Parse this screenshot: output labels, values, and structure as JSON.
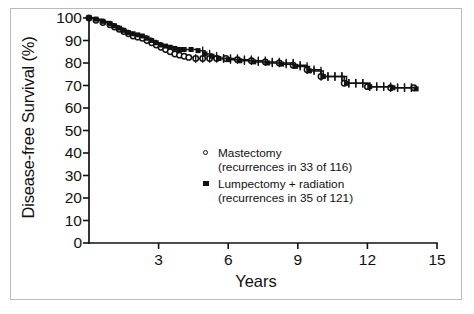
{
  "chart_data": {
    "type": "line",
    "title": "",
    "subtitle": "",
    "xlabel": "Years",
    "ylabel": "Disease-free Survival (%)",
    "xlim": [
      0,
      15
    ],
    "ylim": [
      0,
      100
    ],
    "xticks": [
      3,
      6,
      9,
      12,
      15
    ],
    "yticks": [
      0,
      10,
      20,
      30,
      40,
      50,
      60,
      70,
      80,
      90,
      100
    ],
    "grid": false,
    "legend_position": "center",
    "series": [
      {
        "name": "Mastectomy",
        "annotation": "(recurrences in 33 of 116)",
        "marker": "open-circle",
        "color": "#111111",
        "events": 33,
        "total": 116,
        "x": [
          0.0,
          0.3,
          0.6,
          0.9,
          1.1,
          1.3,
          1.5,
          1.7,
          1.9,
          2.1,
          2.3,
          2.5,
          2.7,
          2.9,
          3.1,
          3.3,
          3.5,
          3.7,
          3.9,
          4.1,
          4.3,
          4.6,
          4.9,
          5.2,
          5.5,
          5.9,
          6.4,
          7.0,
          7.6,
          8.2,
          8.8,
          9.4,
          10.0,
          11.0,
          12.0,
          13.0,
          14.0
        ],
        "y": [
          100,
          99,
          98,
          97,
          96,
          95,
          94,
          93,
          92,
          91.5,
          91,
          90,
          89,
          88,
          87,
          86,
          85,
          84,
          83.5,
          83,
          82.5,
          82,
          82,
          82,
          82,
          82,
          81.5,
          81,
          80.5,
          80,
          79,
          77,
          74,
          71,
          69.5,
          69,
          69
        ]
      },
      {
        "name": "Lumpectomy + radiation",
        "annotation": "(recurrences in 35 of 121)",
        "marker": "filled-square",
        "color": "#111111",
        "events": 35,
        "total": 121,
        "x": [
          0.0,
          0.3,
          0.6,
          0.9,
          1.1,
          1.3,
          1.5,
          1.7,
          1.9,
          2.1,
          2.3,
          2.5,
          2.7,
          2.9,
          3.1,
          3.3,
          3.5,
          3.7,
          3.9,
          4.1,
          4.4,
          4.7,
          5.0,
          5.3,
          5.6,
          6.0,
          6.5,
          7.1,
          7.7,
          8.3,
          8.9,
          9.5,
          10.1,
          11.1,
          12.1,
          13.1,
          14.1
        ],
        "y": [
          100,
          99.5,
          98.5,
          97.5,
          96.5,
          95.5,
          94.5,
          93.5,
          93,
          92.5,
          92,
          91,
          90,
          89,
          88,
          87.5,
          87,
          86.5,
          86,
          86,
          86,
          85.5,
          84,
          83,
          82,
          81.5,
          81,
          80.5,
          80,
          79.5,
          78.5,
          76.5,
          74,
          71,
          69.5,
          69,
          68.5
        ]
      }
    ]
  },
  "legend": {
    "items": [
      {
        "marker": "open-circle",
        "label": "Mastectomy",
        "sub": "(recurrences in 33 of 116)"
      },
      {
        "marker": "filled-square",
        "label": "Lumpectomy + radiation",
        "sub": "(recurrences in 35 of 121)"
      }
    ]
  },
  "axes": {
    "y_title": "Disease-free Survival (%)",
    "x_title": "Years",
    "y_ticks": [
      "100",
      "90",
      "80",
      "70",
      "60",
      "50",
      "40",
      "30",
      "20",
      "10",
      "0"
    ],
    "x_ticks": [
      "3",
      "6",
      "9",
      "12",
      "15"
    ]
  },
  "colors": {
    "ink": "#111111",
    "frame": "#b9b9b9",
    "background": "#ffffff"
  }
}
